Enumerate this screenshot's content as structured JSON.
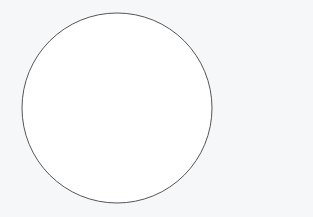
{
  "figure": {
    "shape": "circle",
    "center": [
      117,
      108
    ],
    "radius": 95,
    "stroke_color": "#555555",
    "stroke_width": 1,
    "fill": "#ffffff",
    "background": "#f6f7f8"
  }
}
